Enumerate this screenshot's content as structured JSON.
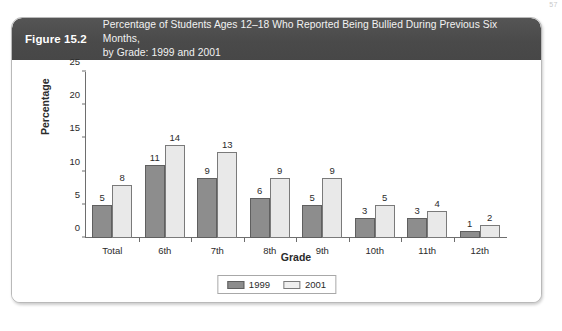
{
  "page_number": "57",
  "figure": {
    "number_label": "Figure 15.2",
    "title_line1": "Percentage of Students Ages 12–18 Who Reported Being Bullied During Previous Six Months,",
    "title_line2": "by Grade: 1999 and 2001",
    "header_bg": "#4a4a4a",
    "header_text_color": "#f2f2f2"
  },
  "chart_data": {
    "type": "bar",
    "title": "Percentage of Students Ages 12–18 Who Reported Being Bullied During Previous Six Months, by Grade: 1999 and 2001",
    "xlabel": "Grade",
    "ylabel": "Percentage",
    "categories": [
      "Total",
      "6th",
      "7th",
      "8th",
      "9th",
      "10th",
      "11th",
      "12th"
    ],
    "series": [
      {
        "name": "1999",
        "color": "#8d8d8d",
        "values": [
          5,
          11,
          9,
          6,
          5,
          3,
          3,
          1
        ]
      },
      {
        "name": "2001",
        "color": "#e9e9e9",
        "values": [
          8,
          14,
          13,
          9,
          9,
          5,
          4,
          2
        ]
      }
    ],
    "ylim": [
      0,
      25
    ],
    "yticks": [
      0,
      5,
      10,
      15,
      20,
      25
    ],
    "grid": false,
    "data_labels": true,
    "legend_position": "bottom-center"
  }
}
